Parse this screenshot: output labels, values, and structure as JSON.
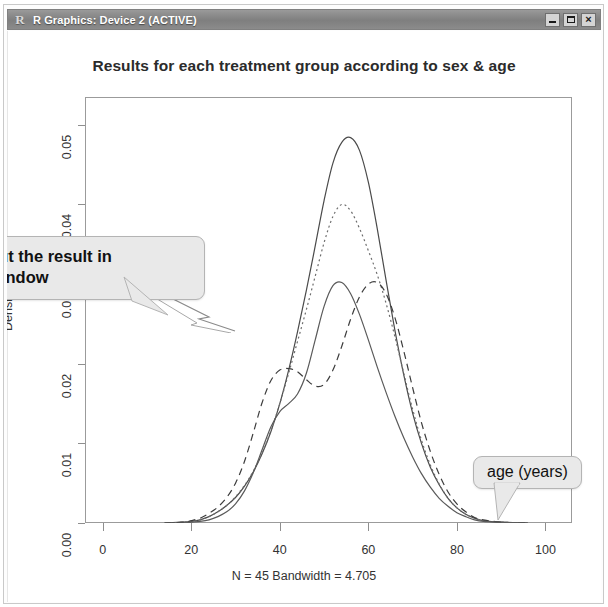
{
  "window": {
    "title": "R Graphics: Device 2 (ACTIVE)",
    "icon_label": "R",
    "controls": {
      "minimize": "minimize-button",
      "maximize": "maximize-button",
      "close": "×"
    }
  },
  "annotations": [
    {
      "id": "left",
      "line1": "eck out the result in",
      "line2_italic": "Gui",
      "line2_rest": " window"
    },
    {
      "id": "right",
      "text": "age (years)"
    }
  ],
  "chart_data": {
    "type": "line",
    "title": "Results for each treatment group according to sex & age",
    "xlabel": "N = 45   Bandwidth = 4.705",
    "ylabel": "Density",
    "xlim": [
      -4,
      106
    ],
    "ylim": [
      0,
      0.0535
    ],
    "xticks": [
      0,
      20,
      40,
      60,
      80,
      100
    ],
    "xtick_labels": [
      "0",
      "20",
      "40",
      "60",
      "80",
      "100"
    ],
    "yticks": [
      0.0,
      0.01,
      0.02,
      0.03,
      0.04,
      0.05
    ],
    "ytick_labels": [
      "0.00",
      "0.01",
      "0.02",
      "0.03",
      "0.04",
      "0.05"
    ],
    "grid": false,
    "legend": "none",
    "axis_note": "0.03 y-label is obscured by the left callout bubble",
    "series": [
      {
        "name": "group-1-solid",
        "style": "solid",
        "color": "#4a4a4a",
        "x": [
          14,
          18,
          20,
          22,
          24,
          26,
          28,
          30,
          32,
          34,
          36,
          38,
          40,
          42,
          44,
          46,
          48,
          50,
          52,
          54,
          56,
          58,
          60,
          62,
          64,
          66,
          68,
          70,
          72,
          74,
          76,
          78,
          80,
          82,
          84,
          86,
          90,
          96
        ],
        "y": [
          0.0,
          0.0001,
          0.0002,
          0.0004,
          0.0008,
          0.0014,
          0.0022,
          0.0032,
          0.0046,
          0.0064,
          0.0087,
          0.0115,
          0.015,
          0.0192,
          0.024,
          0.0292,
          0.0348,
          0.0405,
          0.0452,
          0.0478,
          0.0484,
          0.0468,
          0.0428,
          0.037,
          0.0305,
          0.0242,
          0.0186,
          0.0138,
          0.01,
          0.007,
          0.0048,
          0.0031,
          0.0019,
          0.0011,
          0.0006,
          0.0003,
          0.0001,
          0.0
        ]
      },
      {
        "name": "group-2-dotted",
        "style": "dotted",
        "color": "#6d6d6d",
        "x": [
          14,
          18,
          20,
          22,
          24,
          26,
          28,
          30,
          32,
          34,
          36,
          38,
          40,
          42,
          44,
          46,
          48,
          50,
          52,
          54,
          56,
          58,
          60,
          62,
          64,
          66,
          68,
          70,
          72,
          74,
          76,
          78,
          80,
          82,
          84,
          86,
          90,
          96
        ],
        "y": [
          0.0,
          0.0001,
          0.0002,
          0.0004,
          0.0008,
          0.0014,
          0.0022,
          0.0033,
          0.0047,
          0.0065,
          0.0088,
          0.0116,
          0.015,
          0.0188,
          0.0228,
          0.0268,
          0.031,
          0.0352,
          0.0385,
          0.04,
          0.0392,
          0.037,
          0.0342,
          0.0312,
          0.0276,
          0.0234,
          0.0188,
          0.0143,
          0.0104,
          0.0073,
          0.0049,
          0.0031,
          0.0019,
          0.0011,
          0.0006,
          0.0003,
          0.0001,
          0.0
        ]
      },
      {
        "name": "group-3-dashed",
        "style": "dashed",
        "color": "#3d3d3d",
        "x": [
          14,
          18,
          20,
          22,
          24,
          26,
          28,
          30,
          32,
          34,
          36,
          38,
          40,
          42,
          44,
          46,
          48,
          50,
          52,
          54,
          56,
          58,
          60,
          62,
          64,
          66,
          68,
          70,
          72,
          74,
          76,
          78,
          80,
          82,
          84,
          86,
          90,
          96
        ],
        "y": [
          0.0,
          0.0001,
          0.0003,
          0.0006,
          0.0012,
          0.002,
          0.0032,
          0.005,
          0.0077,
          0.0113,
          0.0151,
          0.0179,
          0.0192,
          0.0194,
          0.019,
          0.018,
          0.0172,
          0.0174,
          0.0192,
          0.0222,
          0.0256,
          0.0284,
          0.03,
          0.0302,
          0.0288,
          0.0258,
          0.0216,
          0.017,
          0.0126,
          0.009,
          0.0061,
          0.0039,
          0.0024,
          0.0014,
          0.0007,
          0.0004,
          0.0001,
          0.0
        ]
      },
      {
        "name": "group-4-solid-low",
        "style": "solid",
        "color": "#5a5a5a",
        "x": [
          14,
          18,
          20,
          22,
          24,
          26,
          28,
          30,
          32,
          34,
          36,
          38,
          40,
          42,
          44,
          46,
          48,
          50,
          52,
          54,
          56,
          58,
          60,
          62,
          64,
          66,
          68,
          70,
          72,
          74,
          76,
          78,
          80,
          82,
          84,
          86,
          90,
          96
        ],
        "y": [
          0.0,
          0.0,
          0.0001,
          0.0002,
          0.0004,
          0.0008,
          0.0014,
          0.0024,
          0.004,
          0.0063,
          0.0092,
          0.0121,
          0.014,
          0.015,
          0.0162,
          0.0188,
          0.023,
          0.0272,
          0.0298,
          0.0302,
          0.0288,
          0.0262,
          0.023,
          0.0196,
          0.0164,
          0.0134,
          0.0107,
          0.0083,
          0.0062,
          0.0045,
          0.0031,
          0.0021,
          0.0013,
          0.0008,
          0.0004,
          0.0002,
          0.0001,
          0.0
        ]
      }
    ]
  }
}
